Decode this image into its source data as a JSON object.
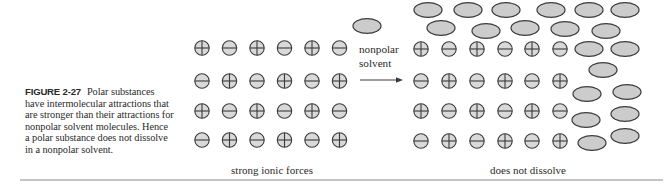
{
  "figure": {
    "label": "FIGURE 2-27",
    "caption": "Polar substances have intermolecular attractions that are stronger than their attractions for nonpolar solvent molecules. Hence a polar substance does not dissolve in a nonpolar solvent."
  },
  "arrow": {
    "label_line1": "nonpolar",
    "label_line2": "solvent"
  },
  "panels": {
    "left": {
      "caption": "strong ionic forces",
      "grid": [
        [
          "+",
          "-",
          "+",
          "-",
          "+",
          "-"
        ],
        [
          "-",
          "+",
          "-",
          "+",
          "-",
          "+"
        ],
        [
          "+",
          "-",
          "+",
          "-",
          "+",
          "-"
        ],
        [
          "-",
          "+",
          "-",
          "+",
          "-",
          "+"
        ]
      ]
    },
    "right": {
      "caption": "does not dissolve",
      "grid": [
        [
          "+",
          "-",
          "+",
          "-",
          "+",
          "-"
        ],
        [
          "-",
          "+",
          "-",
          "+",
          "-",
          "+"
        ],
        [
          "+",
          "-",
          "+",
          "-",
          "+",
          "-"
        ],
        [
          "-",
          "+",
          "-",
          "+",
          "-",
          "+"
        ]
      ]
    }
  },
  "legend": {
    "positive_ion": "circle with plus",
    "negative_ion": "circle with minus",
    "solvent_molecule": "gray ellipse"
  },
  "colors": {
    "ion_fill": "#d9d9d9",
    "solvent_fill": "#cccccc",
    "stroke": "#3a3a3a",
    "rule": "#c4c4c4"
  }
}
